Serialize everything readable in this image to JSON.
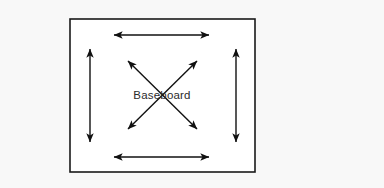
{
  "diagram": {
    "type": "floor-plan-expansion-arrows",
    "canvas": {
      "width": 384,
      "height": 188,
      "background_color": "#f8f8f8"
    },
    "room": {
      "name": "room-outline",
      "x": 70,
      "y": 19,
      "width": 185,
      "height": 153,
      "fill_color": "#ffffff",
      "stroke_color": "#1a1a1a",
      "stroke_width": 1.6
    },
    "center_label": {
      "text": "Baseboard",
      "x": 162,
      "y": 96,
      "color": "#2b2b2b",
      "font_size": 11.5
    },
    "arrow_color": "#111111",
    "arrow_stroke_width": 1.4,
    "arrows": [
      {
        "name": "top-horizontal-arrow",
        "orientation": "horizontal",
        "x1": 114,
        "y1": 35,
        "x2": 209,
        "y2": 35,
        "heads": "both"
      },
      {
        "name": "bottom-horizontal-arrow",
        "orientation": "horizontal",
        "x1": 114,
        "y1": 157,
        "x2": 209,
        "y2": 157,
        "heads": "both"
      },
      {
        "name": "left-vertical-arrow",
        "orientation": "vertical",
        "x1": 90,
        "y1": 49,
        "x2": 90,
        "y2": 142,
        "heads": "both"
      },
      {
        "name": "right-vertical-arrow",
        "orientation": "vertical",
        "x1": 236,
        "y1": 49,
        "x2": 236,
        "y2": 142,
        "heads": "both"
      },
      {
        "name": "diagonal-arrow-nwse",
        "orientation": "diagonal",
        "x1": 128,
        "y1": 61,
        "x2": 197,
        "y2": 129,
        "heads": "both"
      },
      {
        "name": "diagonal-arrow-swne",
        "orientation": "diagonal",
        "x1": 128,
        "y1": 129,
        "x2": 197,
        "y2": 61,
        "heads": "both"
      }
    ]
  }
}
